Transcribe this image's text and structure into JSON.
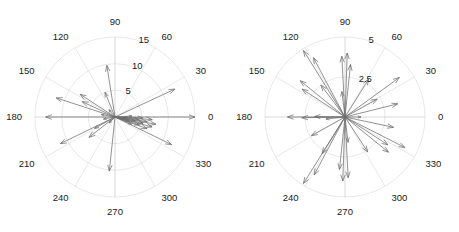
{
  "figure": {
    "width": 459,
    "height": 232,
    "background": "#ffffff",
    "grid_color": "#d8d8d8",
    "vector_color": "#6e6e6e",
    "label_color": "#1a1a1a",
    "panel_count": 2
  },
  "chart_data": [
    {
      "type": "scatter",
      "subtype": "polar-compass",
      "title": "",
      "xlabel": "",
      "ylabel": "",
      "panel": "left",
      "center": [
        115,
        117
      ],
      "outer_radius_px": 80,
      "rlim": [
        0,
        15
      ],
      "rticks": [
        5,
        10,
        15
      ],
      "rtick_labels": [
        "5",
        "10",
        "15"
      ],
      "theta_ticks": [
        0,
        30,
        60,
        90,
        120,
        150,
        180,
        210,
        240,
        270,
        300,
        330
      ],
      "theta_tick_labels": [
        "0",
        "30",
        "60",
        "90",
        "120",
        "150",
        "180",
        "210",
        "240",
        "270",
        "300",
        "330"
      ],
      "theta_direction": "counterclockwise",
      "theta_zero_location": "E",
      "grid": true,
      "legend": "none",
      "vectors": [
        {
          "theta_deg": 0,
          "r": 15.0
        },
        {
          "theta_deg": 180,
          "r": 13.0
        },
        {
          "theta_deg": 25,
          "r": 12.4
        },
        {
          "theta_deg": 162,
          "r": 11.6
        },
        {
          "theta_deg": 206,
          "r": 11.4
        },
        {
          "theta_deg": 334,
          "r": 11.8
        },
        {
          "theta_deg": 99,
          "r": 9.8
        },
        {
          "theta_deg": 264,
          "r": 10.2
        },
        {
          "theta_deg": 147,
          "r": 7.8
        },
        {
          "theta_deg": 218,
          "r": 6.2
        },
        {
          "theta_deg": 155,
          "r": 6.8
        },
        {
          "theta_deg": 112,
          "r": 5.0
        },
        {
          "theta_deg": 209,
          "r": 4.4
        },
        {
          "theta_deg": 350,
          "r": 7.8
        },
        {
          "theta_deg": 345,
          "r": 7.2
        },
        {
          "theta_deg": 356,
          "r": 7.0
        },
        {
          "theta_deg": 340,
          "r": 6.4
        },
        {
          "theta_deg": 352,
          "r": 6.0
        },
        {
          "theta_deg": 347,
          "r": 5.4
        },
        {
          "theta_deg": 358,
          "r": 5.2
        },
        {
          "theta_deg": 342,
          "r": 4.8
        },
        {
          "theta_deg": 354,
          "r": 4.4
        },
        {
          "theta_deg": 349,
          "r": 3.8
        },
        {
          "theta_deg": 337,
          "r": 3.4
        },
        {
          "theta_deg": 3,
          "r": 3.2
        },
        {
          "theta_deg": 344,
          "r": 2.8
        },
        {
          "theta_deg": 358,
          "r": 2.4
        },
        {
          "theta_deg": 351,
          "r": 2.0
        },
        {
          "theta_deg": 170,
          "r": 2.6
        },
        {
          "theta_deg": 190,
          "r": 2.2
        },
        {
          "theta_deg": 130,
          "r": 1.8
        },
        {
          "theta_deg": 225,
          "r": 1.6
        }
      ]
    },
    {
      "type": "scatter",
      "subtype": "polar-compass",
      "title": "",
      "xlabel": "",
      "ylabel": "",
      "panel": "right",
      "center": [
        345,
        117
      ],
      "outer_radius_px": 80,
      "rlim": [
        0,
        5
      ],
      "rticks": [
        2.5,
        5
      ],
      "rtick_labels": [
        "2.5",
        "5"
      ],
      "theta_ticks": [
        0,
        30,
        60,
        90,
        120,
        150,
        180,
        210,
        240,
        270,
        300,
        330
      ],
      "theta_tick_labels": [
        "0",
        "30",
        "60",
        "90",
        "120",
        "150",
        "180",
        "210",
        "240",
        "270",
        "300",
        "330"
      ],
      "theta_direction": "counterclockwise",
      "theta_zero_location": "E",
      "grid": true,
      "legend": "none",
      "vectors": [
        {
          "theta_deg": 122,
          "r": 4.9
        },
        {
          "theta_deg": 238,
          "r": 4.9
        },
        {
          "theta_deg": 118,
          "r": 4.2
        },
        {
          "theta_deg": 242,
          "r": 4.1
        },
        {
          "theta_deg": 36,
          "r": 4.2
        },
        {
          "theta_deg": 333,
          "r": 4.2
        },
        {
          "theta_deg": 88,
          "r": 4.0
        },
        {
          "theta_deg": 268,
          "r": 4.0
        },
        {
          "theta_deg": 93,
          "r": 3.8
        },
        {
          "theta_deg": 273,
          "r": 3.8
        },
        {
          "theta_deg": 84,
          "r": 3.3
        },
        {
          "theta_deg": 264,
          "r": 3.3
        },
        {
          "theta_deg": 141,
          "r": 3.6
        },
        {
          "theta_deg": 321,
          "r": 3.5
        },
        {
          "theta_deg": 147,
          "r": 3.2
        },
        {
          "theta_deg": 327,
          "r": 3.2
        },
        {
          "theta_deg": 14,
          "r": 3.4
        },
        {
          "theta_deg": 348,
          "r": 3.1
        },
        {
          "theta_deg": 180,
          "r": 3.6
        },
        {
          "theta_deg": 181,
          "r": 2.7
        },
        {
          "theta_deg": 179,
          "r": 1.9
        },
        {
          "theta_deg": 58,
          "r": 2.8
        },
        {
          "theta_deg": 238,
          "r": 2.7
        },
        {
          "theta_deg": 303,
          "r": 2.6
        },
        {
          "theta_deg": 127,
          "r": 2.5
        },
        {
          "theta_deg": 209,
          "r": 2.4
        },
        {
          "theta_deg": 29,
          "r": 2.3
        },
        {
          "theta_deg": 97,
          "r": 1.6
        },
        {
          "theta_deg": 277,
          "r": 1.6
        },
        {
          "theta_deg": 186,
          "r": 1.2
        },
        {
          "theta_deg": 0,
          "r": 1.0
        }
      ]
    }
  ]
}
